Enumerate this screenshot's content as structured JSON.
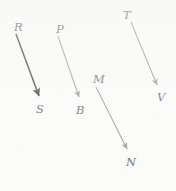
{
  "diagram": {
    "background_color": "#fbfbf9",
    "nodes": [
      {
        "id": "R",
        "label": "R",
        "x": 14,
        "y": 22,
        "color": "#3c3c3c"
      },
      {
        "id": "S",
        "label": "S",
        "x": 36,
        "y": 104,
        "color": "#4a4a4a"
      },
      {
        "id": "P",
        "label": "P",
        "x": 56,
        "y": 24,
        "color": "#4a4a4a"
      },
      {
        "id": "B",
        "label": "B",
        "x": 76,
        "y": 105,
        "color": "#4a4a4a"
      },
      {
        "id": "M",
        "label": "M",
        "x": 93,
        "y": 74,
        "color": "#4a4a4a"
      },
      {
        "id": "N",
        "label": "N",
        "x": 126,
        "y": 157,
        "color": "#4a4a4a"
      },
      {
        "id": "T",
        "label": "T",
        "x": 123,
        "y": 10,
        "color": "#4a4a4a"
      },
      {
        "id": "V",
        "label": "V",
        "x": 157,
        "y": 92,
        "color": "#4a4a4a"
      }
    ],
    "arrows": [
      {
        "id": "arrow-r-s",
        "from": "R",
        "to": "S",
        "x1": 16,
        "y1": 34,
        "x2": 40,
        "y2": 99,
        "color": "#1c1c1c",
        "width": 1.5,
        "head": "filled-triangle"
      },
      {
        "id": "arrow-p-b",
        "from": "P",
        "to": "B",
        "x1": 58,
        "y1": 36,
        "x2": 80,
        "y2": 100,
        "color": "#8d8d8d",
        "width": 1.1,
        "head": "filled-triangle"
      },
      {
        "id": "arrow-m-n",
        "from": "M",
        "to": "N",
        "x1": 96,
        "y1": 87,
        "x2": 128,
        "y2": 152,
        "color": "#8a8a8a",
        "width": 1.1,
        "head": "filled-triangle"
      },
      {
        "id": "arrow-t-v",
        "from": "T",
        "to": "V",
        "x1": 131,
        "y1": 22,
        "x2": 158,
        "y2": 88,
        "color": "#8a8a8a",
        "width": 1.1,
        "head": "filled-triangle"
      }
    ]
  }
}
